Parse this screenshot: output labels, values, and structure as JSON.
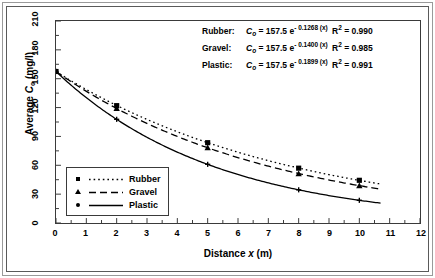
{
  "chart_data": {
    "type": "line",
    "title": "",
    "xlabel": "Distance x (m)",
    "ylabel": "Average Cₒ (mg/l)",
    "xlim": [
      0,
      12
    ],
    "ylim": [
      0,
      210
    ],
    "xticks": [
      0,
      1,
      2,
      3,
      4,
      5,
      6,
      7,
      8,
      9,
      10,
      11,
      12
    ],
    "yticks": [
      0,
      30,
      60,
      90,
      120,
      150,
      180,
      210
    ],
    "grid": false,
    "legend_position": "inside-bottom-left",
    "series": [
      {
        "name": "Rubber",
        "marker": "filled-square",
        "linestyle": "dotted",
        "color": "#000000",
        "C0": 157.5,
        "decay_k": 0.1268,
        "r_squared": 0.99,
        "x": [
          0,
          2,
          5,
          8,
          10
        ],
        "y": [
          157.5,
          122.0,
          83.5,
          57.0,
          44.4
        ]
      },
      {
        "name": "Gravel",
        "marker": "filled-triangle",
        "linestyle": "dashed",
        "color": "#000000",
        "C0": 157.5,
        "decay_k": 0.14,
        "r_squared": 0.985,
        "x": [
          0,
          2,
          5,
          8,
          10
        ],
        "y": [
          157.5,
          119.0,
          78.2,
          51.4,
          38.8
        ]
      },
      {
        "name": "Plastic",
        "marker": "cross",
        "linestyle": "solid",
        "color": "#000000",
        "C0": 157.5,
        "decay_k": 0.1899,
        "r_squared": 0.991,
        "x": [
          0,
          2,
          5,
          8,
          10
        ],
        "y": [
          157.5,
          107.8,
          61.0,
          34.5,
          23.6
        ]
      }
    ]
  },
  "axes": {
    "y_title_prefix": "Average ",
    "y_title_var": "C",
    "y_title_sub": "o",
    "y_title_units": " (mg/l)",
    "x_title_prefix": "Distance ",
    "x_title_var": "x",
    "x_title_units": " (m)"
  },
  "equations": {
    "rows": [
      {
        "name": "Rubber:",
        "var": "C",
        "sub": "o",
        "eq_mid": " = 157.5 e",
        "exponent": "- 0.1268 (x)",
        "r2_label": "R",
        "r2_sup": "2",
        "r2_value": " = 0.990"
      },
      {
        "name": "Gravel:",
        "var": "C",
        "sub": "o",
        "eq_mid": " = 157.5 e",
        "exponent": "- 0.1400 (x)",
        "r2_label": "R",
        "r2_sup": "2",
        "r2_value": " = 0.985"
      },
      {
        "name": "Plastic:",
        "var": "C",
        "sub": "o",
        "eq_mid": " = 157.5 e",
        "exponent": "- 0.1899 (x)",
        "r2_label": "R",
        "r2_sup": "2",
        "r2_value": " = 0.991"
      }
    ]
  },
  "legend": {
    "items": [
      {
        "label": "Rubber",
        "marker": "filled-square",
        "linestyle": "dotted"
      },
      {
        "label": "Gravel",
        "marker": "filled-triangle",
        "linestyle": "dashed"
      },
      {
        "label": "Plastic",
        "marker": "cross",
        "linestyle": "solid"
      }
    ]
  }
}
